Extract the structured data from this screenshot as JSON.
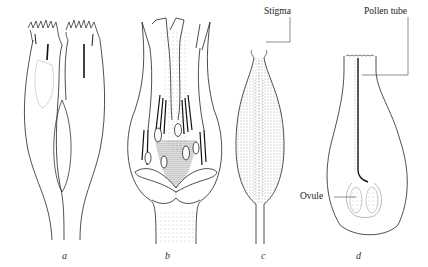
{
  "figure": {
    "panels": [
      {
        "id": "a",
        "label": "a",
        "subject": "two florets, external view"
      },
      {
        "id": "b",
        "label": "b",
        "subject": "flower longitudinal section with anthers and ovules"
      },
      {
        "id": "c",
        "label": "c",
        "subject": "pistil with stigma"
      },
      {
        "id": "d",
        "label": "d",
        "subject": "pistil section with pollen tube and ovule"
      }
    ],
    "callouts": {
      "stigma": "Stigma",
      "pollen_tube": "Pollen tube",
      "ovule": "Ovule"
    },
    "colors": {
      "ink": "#222222",
      "stipple": "#555555",
      "background": "#ffffff"
    }
  }
}
